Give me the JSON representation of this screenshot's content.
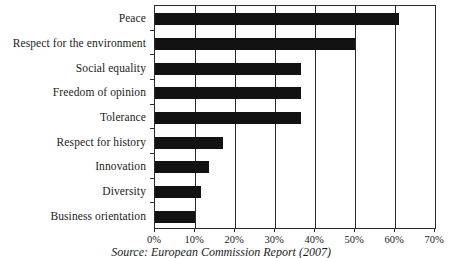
{
  "chart_data": {
    "type": "bar",
    "orientation": "horizontal",
    "title": "",
    "xlabel": "",
    "ylabel": "",
    "xlim": [
      0,
      70
    ],
    "grid": true,
    "legend": false,
    "categories": [
      "Peace",
      "Respect for the environment",
      "Social equality",
      "Freedom of opinion",
      "Tolerance",
      "Respect for history",
      "Innovation",
      "Diversity",
      "Business orientation"
    ],
    "values": [
      61,
      50,
      36.5,
      36.5,
      36.5,
      17,
      13.5,
      11.5,
      10
    ],
    "xticks": [
      0,
      10,
      20,
      30,
      40,
      50,
      60,
      70
    ],
    "xtick_labels": [
      "0%",
      "10%",
      "20%",
      "30%",
      "40%",
      "50%",
      "60%",
      "70%"
    ],
    "bar_color": "#121212",
    "axis_color": "#2a2a2a",
    "background_color": "#ffffff",
    "source": "Source: European Commission Report (2007)"
  }
}
